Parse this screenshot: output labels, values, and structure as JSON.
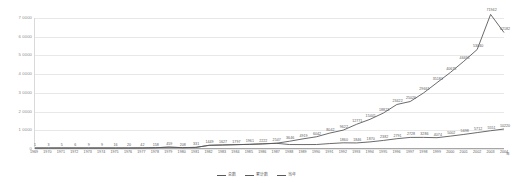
{
  "chart_data": {
    "type": "line",
    "title": "",
    "xlabel": "年",
    "ylabel": "",
    "ylim": [
      0,
      70000
    ],
    "grid": true,
    "legend_position": "bottom",
    "yticks": [
      "0",
      "1 0000",
      "2 0000",
      "3 0000",
      "4 0000",
      "5 0000",
      "6 0000",
      "7 0000"
    ],
    "ytick_values": [
      0,
      10000,
      20000,
      30000,
      40000,
      50000,
      60000,
      70000
    ],
    "categories": [
      "1969",
      "1970",
      "1971",
      "1972",
      "1973",
      "1974",
      "1975",
      "1976",
      "1977",
      "1978",
      "1979",
      "1980",
      "1981",
      "1982",
      "1983",
      "1984",
      "1985",
      "1986",
      "1987",
      "1988",
      "1989",
      "1990",
      "1991",
      "1992",
      "1993",
      "1994",
      "1995",
      "1996",
      "1997",
      "1998",
      "1999",
      "2000",
      "2001",
      "2002",
      "2003",
      "2004"
    ],
    "series": [
      {
        "name": "总数",
        "color": "#595959",
        "values": [
          1,
          3,
          5,
          6,
          9,
          9,
          16,
          20,
          42,
          158,
          459,
          208,
          331,
          1449,
          1627,
          1797,
          1961,
          2222,
          2547,
          3646,
          4919,
          6042,
          8042,
          9622,
          12771,
          15441,
          18823,
          23422,
          25026,
          29661,
          35181,
          40675,
          46691,
          53040,
          71942,
          62182
        ]
      },
      {
        "name": "累计数",
        "color": "#595959",
        "values": [
          1,
          3,
          5,
          6,
          9,
          9,
          16,
          20,
          42,
          158,
          459,
          208,
          331,
          1449,
          1627,
          1797,
          1961,
          2222,
          2547,
          1860,
          1846,
          1870,
          2382,
          2791,
          2728,
          3286,
          4074,
          5002,
          5698,
          5712,
          5551,
          6400,
          7300,
          8300,
          9300,
          10220
        ]
      }
    ],
    "labels_upper": [
      "1",
      "3",
      "5",
      "6",
      "9",
      "9",
      "16",
      "20",
      "42",
      "158",
      "459",
      "208",
      "331",
      "1449",
      "1627",
      "1797",
      "1961",
      "2222",
      "2547",
      "3646",
      "4919",
      "6042",
      "8042",
      "9622",
      "12771",
      "15441",
      "18823",
      "23422",
      "25026",
      "29661",
      "35181",
      "40675",
      "46691",
      "53040",
      "71942",
      "62182"
    ],
    "labels_lower": [
      "1860",
      "1846",
      "1870",
      "2382",
      "2791",
      "2728",
      "3286",
      "4074",
      "5002",
      "5698",
      "5712",
      "5551",
      "10220"
    ]
  },
  "legend": {
    "items": [
      {
        "label": "总数",
        "color": "#595959"
      },
      {
        "label": "累计数",
        "color": "#595959"
      },
      {
        "label": "当年",
        "color": "#595959"
      }
    ]
  }
}
